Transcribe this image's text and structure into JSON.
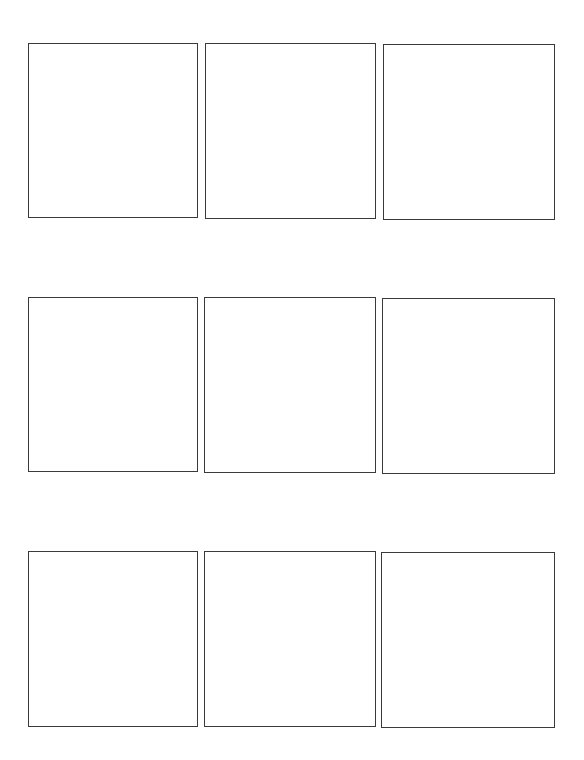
{
  "page": {
    "width": 584,
    "height": 760,
    "background": "#ffffff"
  },
  "grid": {
    "rows": 3,
    "columns": 3,
    "border_color": "#3a3a3a",
    "panels": [
      {
        "row": 1,
        "col": 1,
        "x": 28,
        "y": 43,
        "w": 170,
        "h": 175,
        "content": ""
      },
      {
        "row": 1,
        "col": 2,
        "x": 205,
        "y": 43,
        "w": 171,
        "h": 176,
        "content": ""
      },
      {
        "row": 1,
        "col": 3,
        "x": 383,
        "y": 44,
        "w": 172,
        "h": 176,
        "content": ""
      },
      {
        "row": 2,
        "col": 1,
        "x": 28,
        "y": 297,
        "w": 170,
        "h": 175,
        "content": ""
      },
      {
        "row": 2,
        "col": 2,
        "x": 204,
        "y": 297,
        "w": 172,
        "h": 176,
        "content": ""
      },
      {
        "row": 2,
        "col": 3,
        "x": 382,
        "y": 298,
        "w": 173,
        "h": 176,
        "content": ""
      },
      {
        "row": 3,
        "col": 1,
        "x": 28,
        "y": 551,
        "w": 170,
        "h": 176,
        "content": ""
      },
      {
        "row": 3,
        "col": 2,
        "x": 204,
        "y": 551,
        "w": 172,
        "h": 176,
        "content": ""
      },
      {
        "row": 3,
        "col": 3,
        "x": 381,
        "y": 552,
        "w": 174,
        "h": 176,
        "content": ""
      }
    ]
  }
}
